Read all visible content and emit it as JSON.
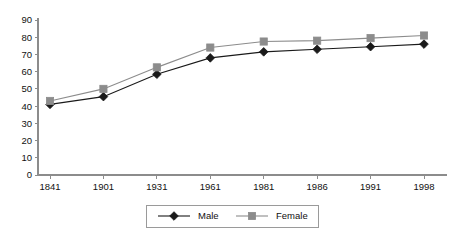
{
  "chart_data": {
    "type": "line",
    "title": "",
    "subtitle": "",
    "xlabel": "",
    "ylabel": "",
    "categories": [
      "1841",
      "1901",
      "1931",
      "1961",
      "1981",
      "1986",
      "1991",
      "1998"
    ],
    "series": [
      {
        "name": "Male",
        "color": "#1a1a1a",
        "marker": "diamond",
        "values": [
          41,
          45.5,
          58.5,
          68,
          71.5,
          73,
          74.5,
          76
        ]
      },
      {
        "name": "Female",
        "color": "#8c8c8c",
        "marker": "square",
        "values": [
          43,
          50,
          62.5,
          74,
          77.5,
          78,
          79.5,
          81
        ]
      }
    ],
    "ylim": [
      0,
      90
    ],
    "ytick_step": 10,
    "ytick_labels": [
      "0",
      "10",
      "20",
      "30",
      "40",
      "50",
      "60",
      "70",
      "80",
      "90"
    ],
    "grid": false,
    "legend_position": "bottom-center",
    "axis_color": "#8c8c8c"
  },
  "legend": {
    "entries": [
      {
        "label": "Male"
      },
      {
        "label": "Female"
      }
    ]
  }
}
